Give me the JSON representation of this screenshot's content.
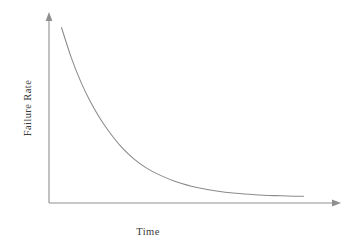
{
  "chart_data": {
    "type": "line",
    "title": "",
    "subtitle": "",
    "xlabel": "Time",
    "ylabel": "Failure Rate",
    "legend": [],
    "annotations": [],
    "grid": false,
    "axes_style": "arrow-tipped open axes, no tick marks, no tick labels",
    "xlim": [
      0,
      1
    ],
    "ylim": [
      0,
      1
    ],
    "xticks": [],
    "yticks": [],
    "series": [
      {
        "name": "Failure Rate",
        "shape": "exponential decay",
        "color": "#8a8a8a",
        "x": [
          0.0,
          0.04,
          0.08,
          0.12,
          0.16,
          0.2,
          0.25,
          0.3,
          0.35,
          0.4,
          0.48,
          0.56,
          0.64,
          0.72,
          0.8,
          0.88,
          0.96,
          1.0
        ],
        "y": [
          1.0,
          0.83,
          0.69,
          0.575,
          0.48,
          0.4,
          0.315,
          0.25,
          0.2,
          0.163,
          0.118,
          0.088,
          0.068,
          0.055,
          0.047,
          0.042,
          0.039,
          0.038
        ]
      }
    ]
  },
  "labels": {
    "y_axis": "Failure Rate",
    "x_axis": "Time"
  },
  "colors": {
    "background": "#ffffff",
    "axis": "#8f8f8f",
    "curve": "#8a8a8a",
    "text": "#3a3a3a"
  }
}
